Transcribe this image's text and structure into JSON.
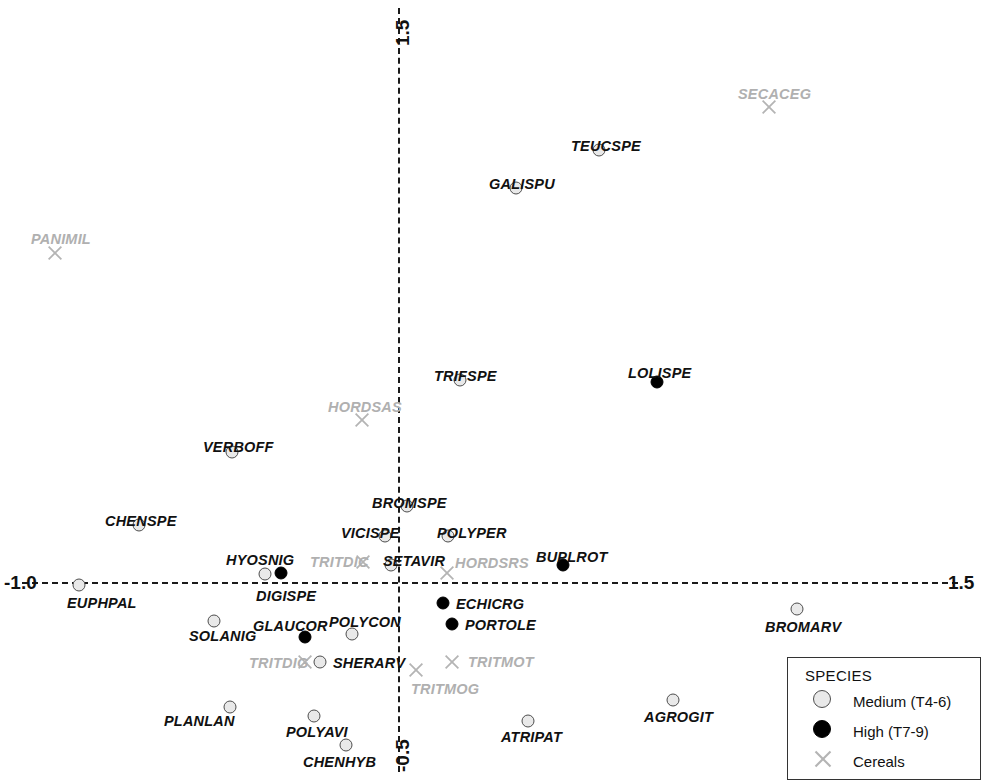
{
  "chart_data": {
    "type": "scatter",
    "title": "",
    "xlabel": "",
    "ylabel": "",
    "xlim": [
      -1.0,
      1.5
    ],
    "ylim": [
      -0.5,
      1.5
    ],
    "grid": false,
    "axis_ticks": {
      "x_min_label": "-1.0",
      "x_max_label": "1.5",
      "y_max_label": "1.5",
      "y_min_label": "-0.5"
    },
    "series": [
      {
        "name": "Medium (T4-6)",
        "marker": "open-circle",
        "color": "#e9e9e9",
        "edge_color": "#4d4d4d",
        "points": [
          {
            "label": "TEUCSPE",
            "x": 0.545,
            "y": 1.13,
            "px": 599,
            "py": 150,
            "lx": 571,
            "ly": 138,
            "anchor": "above"
          },
          {
            "label": "GALISPU",
            "x": 0.318,
            "y": 1.06,
            "px": 516,
            "py": 188,
            "lx": 489,
            "ly": 176,
            "anchor": "above"
          },
          {
            "label": "TRIFSPE",
            "x": 0.165,
            "y": 0.545,
            "px": 460,
            "py": 380,
            "lx": 434,
            "ly": 368,
            "anchor": "above"
          },
          {
            "label": "VERBOFF",
            "x": -0.365,
            "y": 0.398,
            "px": 232,
            "py": 452,
            "lx": 203,
            "ly": 439,
            "anchor": "above"
          },
          {
            "label": "CHENSPE",
            "x": -0.705,
            "y": 0.16,
            "px": 139,
            "py": 525,
            "lx": 105,
            "ly": 513,
            "anchor": "above"
          },
          {
            "label": "BROMSPE",
            "x": 0.025,
            "y": 0.208,
            "px": 407,
            "py": 506,
            "lx": 372,
            "ly": 495,
            "anchor": "above"
          },
          {
            "label": "VICISPE",
            "x": -0.035,
            "y": 0.128,
            "px": 385,
            "py": 536,
            "lx": 341,
            "ly": 525,
            "anchor": "above"
          },
          {
            "label": "POLYPER",
            "x": 0.135,
            "y": 0.128,
            "px": 448,
            "py": 536,
            "lx": 437,
            "ly": 525,
            "anchor": "above"
          },
          {
            "label": "SETAVIR",
            "x": -0.02,
            "y": 0.045,
            "px": 391,
            "py": 565,
            "lx": 383,
            "ly": 553,
            "anchor": "above"
          },
          {
            "label": "HYOSNIG",
            "x": -0.36,
            "y": 0.022,
            "px": 265,
            "py": 574,
            "lx": 226,
            "ly": 552,
            "anchor": "above"
          },
          {
            "label": "EUPHPAL",
            "x": -0.865,
            "y": -0.008,
            "px": 79,
            "py": 585,
            "lx": 67,
            "ly": 595,
            "anchor": "below"
          },
          {
            "label": "SOLANIG",
            "x": -0.5,
            "y": -0.105,
            "px": 214,
            "py": 621,
            "lx": 189,
            "ly": 628,
            "anchor": "below"
          },
          {
            "label": "POLYCON",
            "x": -0.295,
            "y": -0.14,
            "px": 352,
            "py": 634,
            "lx": 329,
            "ly": 614,
            "anchor": "above"
          },
          {
            "label": "SHERARV",
            "x": -0.215,
            "y": -0.215,
            "px": 320,
            "py": 662,
            "lx": 333,
            "ly": 655,
            "anchor": "right"
          },
          {
            "label": "BROMARV",
            "x": 1.085,
            "y": -0.085,
            "px": 797,
            "py": 609,
            "lx": 765,
            "ly": 619,
            "anchor": "below"
          },
          {
            "label": "AGROGIT",
            "x": 0.73,
            "y": -0.355,
            "px": 673,
            "py": 700,
            "lx": 644,
            "ly": 709,
            "anchor": "below"
          },
          {
            "label": "ATRIPAT",
            "x": 0.355,
            "y": -0.41,
            "px": 528,
            "py": 721,
            "lx": 501,
            "ly": 729,
            "anchor": "below"
          },
          {
            "label": "PLANLAN",
            "x": -0.43,
            "y": -0.375,
            "px": 230,
            "py": 707,
            "lx": 164,
            "ly": 713,
            "anchor": "left"
          },
          {
            "label": "POLYAVI",
            "x": -0.2,
            "y": -0.4,
            "px": 314,
            "py": 716,
            "lx": 286,
            "ly": 724,
            "anchor": "below"
          },
          {
            "label": "CHENHYB",
            "x": -0.115,
            "y": -0.475,
            "px": 346,
            "py": 745,
            "lx": 303,
            "ly": 754,
            "anchor": "below"
          }
        ]
      },
      {
        "name": "High (T7-9)",
        "marker": "filled-circle",
        "color": "#000000",
        "points": [
          {
            "label": "LOLISPE",
            "x": 0.7,
            "y": 0.53,
            "px": 657,
            "py": 382,
            "lx": 628,
            "ly": 365,
            "anchor": "above"
          },
          {
            "label": "BUPLROT",
            "x": 0.445,
            "y": 0.045,
            "px": 563,
            "py": 565,
            "lx": 536,
            "ly": 549,
            "anchor": "above"
          },
          {
            "label": "DIGISPE",
            "x": -0.317,
            "y": 0.025,
            "px": 281,
            "py": 573,
            "lx": 256,
            "ly": 588,
            "anchor": "below"
          },
          {
            "label": "ECHICRG",
            "x": 0.12,
            "y": -0.055,
            "px": 443,
            "py": 603,
            "lx": 456,
            "ly": 596,
            "anchor": "right"
          },
          {
            "label": "PORTOLE",
            "x": 0.145,
            "y": -0.11,
            "px": 452,
            "py": 624,
            "lx": 465,
            "ly": 617,
            "anchor": "right"
          },
          {
            "label": "GLAUCOR",
            "x": -0.28,
            "y": -0.16,
            "px": 305,
            "py": 637,
            "lx": 253,
            "ly": 618,
            "anchor": "above"
          }
        ]
      },
      {
        "name": "Cereals",
        "marker": "cross",
        "color": "#b4b4b4",
        "points": [
          {
            "label": "SECACEG",
            "x": 1.005,
            "y": 1.245,
            "px": 769,
            "py": 107,
            "lx": 738,
            "ly": 86,
            "anchor": "above"
          },
          {
            "label": "PANIMIL",
            "x": -0.855,
            "y": 0.855,
            "px": 55,
            "py": 253,
            "lx": 31,
            "ly": 231,
            "anchor": "above"
          },
          {
            "label": "HORDSAS",
            "x": -0.095,
            "y": 0.425,
            "px": 362,
            "py": 420,
            "lx": 328,
            "ly": 399,
            "anchor": "above"
          },
          {
            "label": "TRITDIC",
            "x": -0.24,
            "y": 0.04,
            "px": 363,
            "py": 562,
            "lx": 310,
            "ly": 554,
            "anchor": "left"
          },
          {
            "label": "HORDSRS",
            "x": 0.135,
            "y": 0.022,
            "px": 447,
            "py": 573,
            "lx": 455,
            "ly": 555,
            "anchor": "above"
          },
          {
            "label": "TRITDIG",
            "x": -0.255,
            "y": -0.215,
            "px": 305,
            "py": 662,
            "lx": 249,
            "ly": 655,
            "anchor": "left"
          },
          {
            "label": "TRITMOT",
            "x": 0.15,
            "y": -0.21,
            "px": 452,
            "py": 662,
            "lx": 468,
            "ly": 654,
            "anchor": "right"
          },
          {
            "label": "TRITMOG",
            "x": 0.055,
            "y": -0.235,
            "px": 416,
            "py": 670,
            "lx": 411,
            "ly": 681,
            "anchor": "below"
          }
        ]
      }
    ],
    "legend": {
      "position": "bottom-right",
      "title": "SPECIES",
      "entries": [
        {
          "label": "Medium (T4-6)",
          "marker": "open-circle"
        },
        {
          "label": "High (T7-9)",
          "marker": "filled-circle"
        },
        {
          "label": "Cereals",
          "marker": "cross"
        }
      ]
    }
  }
}
